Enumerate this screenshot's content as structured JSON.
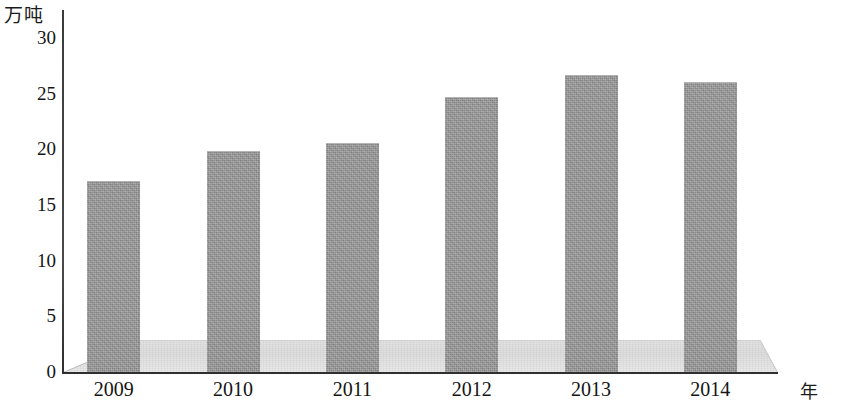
{
  "chart_data": {
    "type": "bar",
    "title": "",
    "subtitle": "",
    "xlabel": "年",
    "ylabel": "万吨",
    "categories": [
      "2009",
      "2010",
      "2011",
      "2012",
      "2013",
      "2014"
    ],
    "values": [
      17.1,
      19.8,
      20.5,
      24.6,
      26.6,
      26.0
    ],
    "series": [
      {
        "name": "",
        "values": [
          17.1,
          19.8,
          20.5,
          24.6,
          26.6,
          26.0
        ]
      }
    ],
    "ylim": [
      0,
      30
    ],
    "y_ticks": [
      0,
      5,
      10,
      15,
      20,
      25,
      30
    ],
    "y_tick_labels": [
      "0",
      "5",
      "10",
      "15",
      "20",
      "25",
      "30"
    ],
    "grid": false,
    "legend": false,
    "legend_position": "none",
    "bar_color": "#9a9a9a",
    "axis_color": "#2f2f2f",
    "floor_color": "#e2e2e2",
    "style_3d": true,
    "annotations": []
  },
  "axes": {
    "y_unit_label": "万吨",
    "x_unit_label": "年"
  },
  "y_ticks": [
    {
      "label": "30",
      "value": 30
    },
    {
      "label": "25",
      "value": 25
    },
    {
      "label": "20",
      "value": 20
    },
    {
      "label": "15",
      "value": 15
    },
    {
      "label": "10",
      "value": 10
    },
    {
      "label": "5",
      "value": 5
    },
    {
      "label": "0",
      "value": 0
    }
  ],
  "bars": [
    {
      "label": "2009",
      "value": 17.1
    },
    {
      "label": "2010",
      "value": 19.8
    },
    {
      "label": "2011",
      "value": 20.5
    },
    {
      "label": "2012",
      "value": 24.6
    },
    {
      "label": "2013",
      "value": 26.6
    },
    {
      "label": "2014",
      "value": 26.0
    }
  ]
}
